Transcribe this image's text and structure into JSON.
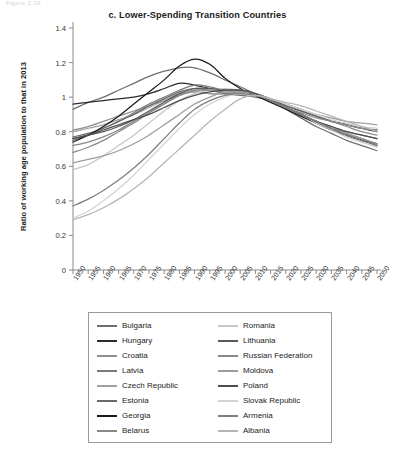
{
  "top_strip_text": "Figure 2.10",
  "chart_data": {
    "type": "line",
    "title": "c. Lower-Spending Transition Countries",
    "xlabel": "",
    "ylabel": "Ratio of working age population to that in 2013",
    "xlim": [
      1950,
      2050
    ],
    "ylim": [
      0,
      1.4
    ],
    "ytick_values": [
      0,
      0.2,
      0.4,
      0.6,
      0.8,
      1,
      1.2,
      1.4
    ],
    "ytick_labels": [
      "0",
      "0.2",
      "0.4",
      "0.6",
      "0.8",
      "1",
      "1.2",
      "1.4"
    ],
    "xtick_values": [
      1950,
      1955,
      1960,
      1965,
      1970,
      1975,
      1980,
      1985,
      1990,
      1995,
      2000,
      2005,
      2010,
      2015,
      2020,
      2025,
      2030,
      2035,
      2040,
      2045,
      2050
    ],
    "xtick_labels": [
      "1950",
      "1955",
      "1960",
      "1965",
      "1970",
      "1975",
      "1980",
      "1985",
      "1990",
      "1995",
      "2000",
      "2005",
      "2010",
      "2015",
      "2020",
      "2025",
      "2030",
      "2035",
      "2040",
      "2045",
      "2050"
    ],
    "grid": false,
    "legend_position": "below",
    "normalization_year": 2013,
    "x": [
      1950,
      1955,
      1960,
      1965,
      1970,
      1975,
      1980,
      1985,
      1990,
      1995,
      2000,
      2005,
      2010,
      2015,
      2020,
      2025,
      2030,
      2035,
      2040,
      2045,
      2050
    ],
    "series": [
      {
        "name": "Bulgaria",
        "color": "#6e6e6e",
        "values": [
          0.93,
          0.97,
          1.0,
          1.04,
          1.08,
          1.12,
          1.15,
          1.17,
          1.17,
          1.14,
          1.1,
          1.06,
          1.02,
          0.98,
          0.93,
          0.88,
          0.83,
          0.79,
          0.75,
          0.72,
          0.69
        ]
      },
      {
        "name": "Hungary",
        "color": "#2b2b2b",
        "values": [
          0.96,
          0.97,
          0.98,
          0.99,
          1.0,
          1.02,
          1.05,
          1.08,
          1.07,
          1.05,
          1.04,
          1.04,
          1.02,
          0.99,
          0.95,
          0.92,
          0.89,
          0.86,
          0.84,
          0.82,
          0.8
        ]
      },
      {
        "name": "Croatia",
        "color": "#8f8f8f",
        "values": [
          0.81,
          0.83,
          0.86,
          0.89,
          0.92,
          0.95,
          0.98,
          1.01,
          1.03,
          1.02,
          1.02,
          1.02,
          1.01,
          0.99,
          0.96,
          0.93,
          0.89,
          0.86,
          0.83,
          0.8,
          0.78
        ]
      },
      {
        "name": "Latvia",
        "color": "#7a7a7a",
        "values": [
          0.75,
          0.78,
          0.82,
          0.86,
          0.91,
          0.96,
          1.0,
          1.04,
          1.07,
          1.06,
          1.04,
          1.03,
          1.01,
          0.98,
          0.94,
          0.9,
          0.86,
          0.82,
          0.78,
          0.75,
          0.72
        ]
      },
      {
        "name": "Czech Republic",
        "color": "#a0a0a0",
        "values": [
          0.8,
          0.82,
          0.84,
          0.87,
          0.9,
          0.94,
          0.98,
          1.02,
          1.03,
          1.02,
          1.02,
          1.03,
          1.02,
          0.99,
          0.96,
          0.93,
          0.9,
          0.88,
          0.86,
          0.85,
          0.84
        ]
      },
      {
        "name": "Estonia",
        "color": "#6a6a6a",
        "values": [
          0.77,
          0.79,
          0.82,
          0.86,
          0.9,
          0.95,
          0.99,
          1.03,
          1.05,
          1.04,
          1.02,
          1.01,
          1.0,
          0.98,
          0.95,
          0.92,
          0.89,
          0.86,
          0.84,
          0.82,
          0.81
        ]
      },
      {
        "name": "Georgia",
        "color": "#1a1a1a",
        "values": [
          0.74,
          0.78,
          0.83,
          0.89,
          0.96,
          1.03,
          1.1,
          1.18,
          1.22,
          1.19,
          1.11,
          1.05,
          1.01,
          0.97,
          0.93,
          0.89,
          0.85,
          0.81,
          0.78,
          0.75,
          0.73
        ]
      },
      {
        "name": "Belarus",
        "color": "#878787",
        "values": [
          0.72,
          0.74,
          0.77,
          0.81,
          0.86,
          0.91,
          0.96,
          1.01,
          1.04,
          1.04,
          1.03,
          1.03,
          1.02,
          0.98,
          0.94,
          0.9,
          0.86,
          0.83,
          0.8,
          0.78,
          0.76
        ]
      },
      {
        "name": "Romania",
        "color": "#c6c6c6",
        "values": [
          0.58,
          0.61,
          0.66,
          0.72,
          0.78,
          0.85,
          0.92,
          0.98,
          1.02,
          1.04,
          1.05,
          1.04,
          1.02,
          0.98,
          0.94,
          0.9,
          0.85,
          0.81,
          0.77,
          0.74,
          0.71
        ]
      },
      {
        "name": "Lithuania",
        "color": "#5a5a5a",
        "values": [
          0.76,
          0.78,
          0.8,
          0.83,
          0.87,
          0.92,
          0.97,
          1.02,
          1.05,
          1.05,
          1.04,
          1.04,
          1.02,
          0.98,
          0.94,
          0.9,
          0.86,
          0.82,
          0.79,
          0.76,
          0.73
        ]
      },
      {
        "name": "Russian Federation",
        "color": "#8a8a8a",
        "values": [
          0.68,
          0.71,
          0.75,
          0.8,
          0.85,
          0.91,
          0.96,
          1.01,
          1.04,
          1.04,
          1.04,
          1.04,
          1.02,
          0.98,
          0.94,
          0.91,
          0.88,
          0.86,
          0.84,
          0.82,
          0.81
        ]
      },
      {
        "name": "Moldova",
        "color": "#9c9c9c",
        "values": [
          0.62,
          0.64,
          0.66,
          0.69,
          0.73,
          0.78,
          0.84,
          0.9,
          0.96,
          1.0,
          1.03,
          1.03,
          1.02,
          0.98,
          0.94,
          0.9,
          0.86,
          0.82,
          0.79,
          0.76,
          0.73
        ]
      },
      {
        "name": "Poland",
        "color": "#4f4f4f",
        "values": [
          0.76,
          0.78,
          0.81,
          0.84,
          0.87,
          0.9,
          0.94,
          0.98,
          1.01,
          1.03,
          1.04,
          1.04,
          1.02,
          0.98,
          0.94,
          0.9,
          0.86,
          0.83,
          0.8,
          0.78,
          0.76
        ]
      },
      {
        "name": "Slovak Republic",
        "color": "#d2d2d2",
        "values": [
          0.3,
          0.34,
          0.4,
          0.47,
          0.55,
          0.64,
          0.73,
          0.82,
          0.9,
          0.96,
          1.0,
          1.02,
          1.01,
          0.99,
          0.96,
          0.93,
          0.9,
          0.87,
          0.85,
          0.83,
          0.82
        ]
      },
      {
        "name": "Armenia",
        "color": "#7d7d7d",
        "values": [
          0.37,
          0.41,
          0.46,
          0.52,
          0.59,
          0.67,
          0.76,
          0.85,
          0.93,
          0.98,
          1.01,
          1.02,
          1.01,
          0.98,
          0.94,
          0.9,
          0.86,
          0.82,
          0.78,
          0.75,
          0.72
        ]
      },
      {
        "name": "Albania",
        "color": "#b5b5b5",
        "values": [
          0.29,
          0.32,
          0.36,
          0.41,
          0.47,
          0.54,
          0.62,
          0.7,
          0.78,
          0.86,
          0.93,
          0.99,
          1.01,
          0.99,
          0.97,
          0.95,
          0.92,
          0.89,
          0.86,
          0.83,
          0.8
        ]
      }
    ]
  },
  "legend": {
    "columns": [
      [
        "Bulgaria",
        "Hungary",
        "Croatia",
        "Latvia",
        "Czech Republic",
        "Estonia",
        "Georgia",
        "Belarus"
      ],
      [
        "Romania",
        "Lithuania",
        "Russian Federation",
        "Moldova",
        "Poland",
        "Slovak Republic",
        "Armenia",
        "Albania"
      ]
    ]
  }
}
